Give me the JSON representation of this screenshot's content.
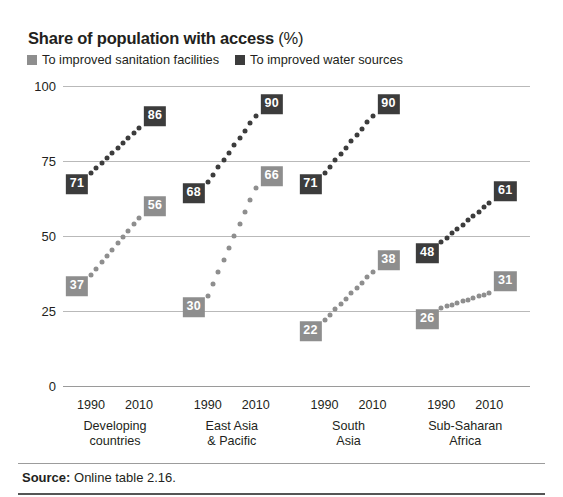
{
  "title": {
    "main": "Share of population with access",
    "unit": "(%)"
  },
  "legend": [
    {
      "label": "To improved sanitation facilities",
      "key": "sanitation",
      "color": "#8e8e8e"
    },
    {
      "label": "To improved water sources",
      "key": "water",
      "color": "#3c3c3c"
    }
  ],
  "source": {
    "label": "Source:",
    "text": "Online table 2.16."
  },
  "chart_data": {
    "type": "line",
    "title": "Share of population with access (%)",
    "xlabel": "",
    "ylabel": "",
    "ylim": [
      0,
      100
    ],
    "yticks": [
      0,
      25,
      50,
      75,
      100
    ],
    "ytick_labels": [
      "0",
      "25",
      "50",
      "75",
      "100"
    ],
    "grid": true,
    "legend_position": "top-left",
    "x": [
      "1990",
      "2010"
    ],
    "categories": [
      "Developing countries",
      "East Asia & Pacific",
      "South Asia",
      "Sub-Saharan Africa"
    ],
    "groups": [
      {
        "name": "Developing countries",
        "name_lines": [
          "Developing",
          "countries"
        ],
        "xticks": [
          "1990",
          "2010"
        ],
        "series": [
          {
            "name": "To improved sanitation facilities",
            "key": "sanitation",
            "values": [
              37,
              56
            ],
            "color": "#8e8e8e"
          },
          {
            "name": "To improved water sources",
            "key": "water",
            "values": [
              71,
              86
            ],
            "color": "#3c3c3c"
          }
        ]
      },
      {
        "name": "East Asia & Pacific",
        "name_lines": [
          "East Asia",
          "& Pacific"
        ],
        "xticks": [
          "1990",
          "2010"
        ],
        "series": [
          {
            "name": "To improved sanitation facilities",
            "key": "sanitation",
            "values": [
              30,
              66
            ],
            "color": "#8e8e8e"
          },
          {
            "name": "To improved water sources",
            "key": "water",
            "values": [
              68,
              90
            ],
            "color": "#3c3c3c"
          }
        ]
      },
      {
        "name": "South Asia",
        "name_lines": [
          "South",
          "Asia"
        ],
        "xticks": [
          "1990",
          "2010"
        ],
        "series": [
          {
            "name": "To improved sanitation facilities",
            "key": "sanitation",
            "values": [
              22,
              38
            ],
            "color": "#8e8e8e"
          },
          {
            "name": "To improved water sources",
            "key": "water",
            "values": [
              71,
              90
            ],
            "color": "#3c3c3c"
          }
        ]
      },
      {
        "name": "Sub-Saharan Africa",
        "name_lines": [
          "Sub-Saharan",
          "Africa"
        ],
        "xticks": [
          "1990",
          "2010"
        ],
        "series": [
          {
            "name": "To improved sanitation facilities",
            "key": "sanitation",
            "values": [
              26,
              31
            ],
            "color": "#8e8e8e"
          },
          {
            "name": "To improved water sources",
            "key": "water",
            "values": [
              48,
              61
            ],
            "color": "#3c3c3c"
          }
        ]
      }
    ]
  }
}
